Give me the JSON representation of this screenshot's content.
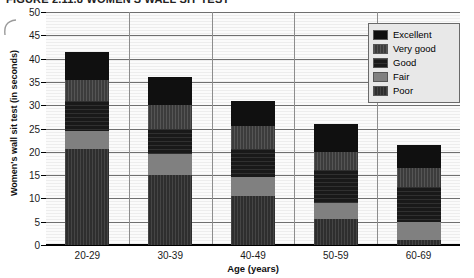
{
  "title": "FIGURE 2.11.8  WOMEN'S WALL SIT TEST",
  "axes": {
    "ylabel": "Women's wall sit test (in seconds)",
    "xlabel": "Age (years)",
    "yticks": [
      "0",
      "5",
      "10",
      "15",
      "20",
      "25",
      "30",
      "35",
      "40",
      "45",
      "50"
    ]
  },
  "legend": {
    "items": [
      {
        "label": "Excellent",
        "color": "#101010",
        "key": "excellent"
      },
      {
        "label": "Very good",
        "color": "#3c3c3c",
        "key": "verygood"
      },
      {
        "label": "Good",
        "color": "#191919",
        "key": "good"
      },
      {
        "label": "Fair",
        "color": "#808080",
        "key": "fair"
      },
      {
        "label": "Poor",
        "color": "#2e2e2e",
        "key": "poor"
      }
    ]
  },
  "chart_data": {
    "type": "bar",
    "subtype": "stacked-vertical",
    "title": "FIGURE 2.11.8  WOMEN'S WALL SIT TEST",
    "xlabel": "Age (years)",
    "ylabel": "Women's wall sit test (in seconds)",
    "ylim": [
      0,
      50
    ],
    "ytick_step": 5,
    "grid": "horizontal-and-vertical",
    "legend_position": "top-right-inside",
    "categories": [
      "20-29",
      "30-39",
      "40-49",
      "50-59",
      "60-69"
    ],
    "series": [
      {
        "name": "Poor",
        "color": "#2e2e2e",
        "values": [
          20.5,
          15.0,
          10.5,
          5.5,
          1.0
        ]
      },
      {
        "name": "Fair",
        "color": "#808080",
        "values": [
          4.0,
          4.5,
          4.0,
          3.5,
          4.0
        ]
      },
      {
        "name": "Good",
        "color": "#191919",
        "values": [
          6.5,
          5.5,
          6.0,
          7.0,
          7.5
        ]
      },
      {
        "name": "Very good",
        "color": "#3c3c3c",
        "values": [
          4.5,
          5.0,
          5.0,
          4.0,
          4.0
        ]
      },
      {
        "name": "Excellent",
        "color": "#101010",
        "values": [
          6.0,
          6.0,
          5.5,
          6.0,
          5.0
        ]
      }
    ],
    "cumulative_tops": {
      "20-29": [
        20.5,
        24.5,
        31.0,
        35.5,
        41.5
      ],
      "30-39": [
        15.0,
        19.5,
        25.0,
        30.0,
        36.0
      ],
      "40-49": [
        10.5,
        14.5,
        20.5,
        25.5,
        31.0
      ],
      "50-59": [
        5.5,
        9.0,
        16.0,
        20.0,
        26.0
      ],
      "60-69": [
        1.0,
        5.0,
        12.5,
        16.5,
        21.5
      ]
    },
    "totals": [
      41.5,
      36.0,
      31.0,
      26.0,
      21.5
    ]
  }
}
